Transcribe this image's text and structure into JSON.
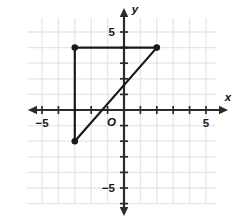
{
  "chart_data": {
    "type": "scatter",
    "title": "",
    "xlabel": "x",
    "ylabel": "y",
    "origin_label": "O",
    "xlim": [
      -6.5,
      7.3
    ],
    "ylim": [
      -6.5,
      6.2
    ],
    "grid": true,
    "grid_color": "#e6e6e6",
    "axis_color": "#2b2b2b",
    "shape_color": "#1a1a1a",
    "background": "#ffffff",
    "x_tick_labels": [
      {
        "value": -5,
        "text": "−5"
      },
      {
        "value": 5,
        "text": "5"
      }
    ],
    "y_tick_labels": [
      {
        "value": 5,
        "text": "5"
      },
      {
        "value": -5,
        "text": "−5"
      }
    ],
    "x_ticks": [
      -6,
      -5,
      -4,
      -3,
      -2,
      -1,
      1,
      2,
      3,
      4,
      5,
      6
    ],
    "y_ticks": [
      -6,
      -5,
      -4,
      -3,
      -2,
      -1,
      1,
      2,
      3,
      4,
      5
    ],
    "series": [
      {
        "name": "triangle",
        "closed": false,
        "points": [
          {
            "x": -3,
            "y": 4,
            "label": ""
          },
          {
            "x": 2,
            "y": 4,
            "label": ""
          },
          {
            "x": -3,
            "y": -2,
            "label": ""
          }
        ],
        "segments": [
          {
            "from": {
              "x": -3,
              "y": 4
            },
            "to": {
              "x": 2,
              "y": 4
            }
          },
          {
            "from": {
              "x": -3,
              "y": 4
            },
            "to": {
              "x": -3,
              "y": -2
            }
          },
          {
            "from": {
              "x": -3,
              "y": -2
            },
            "to": {
              "x": 2,
              "y": 4
            }
          }
        ],
        "vertices": [
          {
            "x": -3,
            "y": 4
          },
          {
            "x": 2,
            "y": 4
          },
          {
            "x": -3,
            "y": -2
          }
        ]
      }
    ],
    "annotations": []
  }
}
